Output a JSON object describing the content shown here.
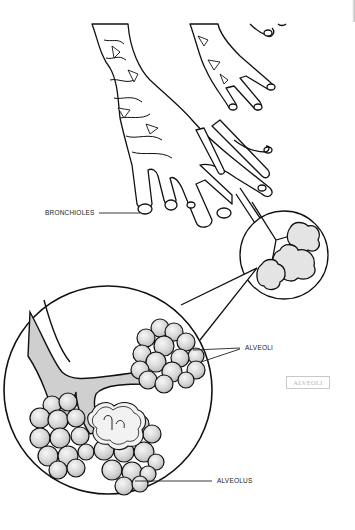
{
  "diagram": {
    "labels": {
      "bronchioles": "BRONCHIOLES",
      "alveoli": "ALVEOLI",
      "alveolus": "ALVEOLUS",
      "answer_box": "ALVEOLI"
    },
    "colors": {
      "line": "#111111",
      "fill_light": "#e9e9e9",
      "fill_mid": "#cfcfcf",
      "background": "#ffffff",
      "answer_box_border": "#c8c8c8",
      "answer_box_text": "#b5b5b5"
    }
  }
}
